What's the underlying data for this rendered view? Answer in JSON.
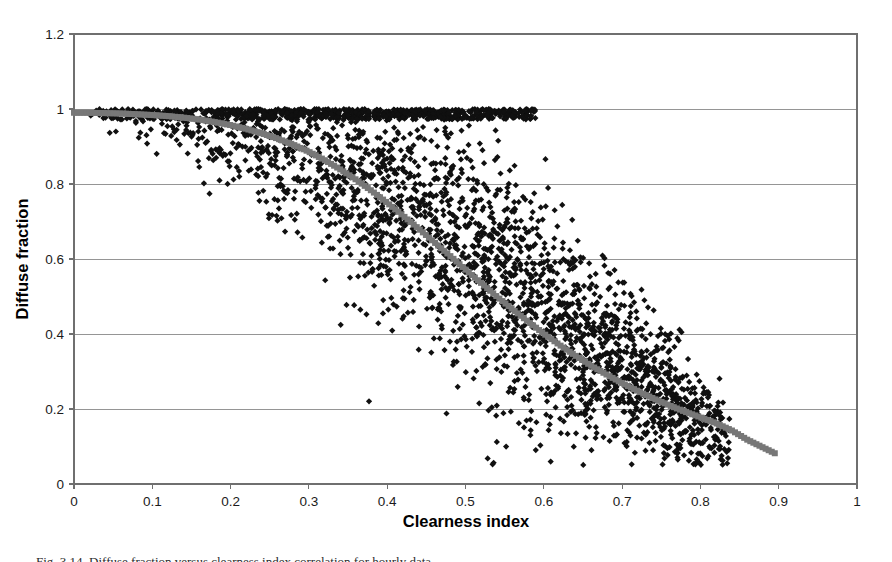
{
  "figure": {
    "background_color": "#ffffff",
    "caption": "Fig. 3.14. Diffuse fraction versus clearness index correlation for hourly data."
  },
  "chart_data": {
    "type": "scatter",
    "title": "",
    "xlabel": "Clearness index",
    "ylabel": "Diffuse fraction",
    "xlim": [
      0,
      1
    ],
    "ylim": [
      0,
      1.2
    ],
    "xticks": [
      0,
      0.1,
      0.2,
      0.3,
      0.4,
      0.5,
      0.6,
      0.7,
      0.8,
      0.9,
      1
    ],
    "yticks": [
      0,
      0.2,
      0.4,
      0.6,
      0.8,
      1,
      1.2
    ],
    "xtick_labels": [
      "0",
      "0.1",
      "0.2",
      "0.3",
      "0.4",
      "0.5",
      "0.6",
      "0.7",
      "0.8",
      "0.9",
      "1"
    ],
    "ytick_labels": [
      "0",
      "0.2",
      "0.4",
      "0.6",
      "0.8",
      "1",
      "1.2"
    ],
    "grid": "horizontal",
    "grid_color": "#8a8a8a",
    "frame_color": "#6f6f6f",
    "legend": "none",
    "series": [
      {
        "name": "Measured hourly data",
        "marker": "diamond",
        "color": "#101010",
        "marker_size": 5.0,
        "point_count": 2600,
        "description": "Black diamond scatter cloud of measured diffuse fraction versus clearness index; saturated near diffuse fraction 1.0 for clearness index below 0.2, broad spread between 0.2 and 0.8, converging toward 0.1 at high clearness index.",
        "generator": {
          "kind": "diffuse-fraction-cloud",
          "seed": 20240517,
          "kt_min": 0.01,
          "kt_max": 0.84,
          "kt_mode": 0.62,
          "kt_shape_a": 2.45,
          "kt_shape_b": 1.42,
          "top_clip": 1.0,
          "top_clip_kt_limit": 0.59,
          "bottom_clip": 0.05,
          "mean_curve": {
            "note": "piecewise mean diffuse fraction versus clearness index",
            "kt": [
              0.0,
              0.05,
              0.1,
              0.15,
              0.2,
              0.25,
              0.3,
              0.35,
              0.4,
              0.45,
              0.5,
              0.55,
              0.6,
              0.65,
              0.7,
              0.75,
              0.8,
              0.84
            ],
            "kd": [
              0.985,
              0.982,
              0.975,
              0.962,
              0.942,
              0.912,
              0.872,
              0.82,
              0.758,
              0.688,
              0.612,
              0.532,
              0.452,
              0.375,
              0.3,
              0.232,
              0.172,
              0.135
            ]
          },
          "spread": {
            "kt": [
              0.0,
              0.05,
              0.1,
              0.15,
              0.2,
              0.25,
              0.3,
              0.35,
              0.4,
              0.45,
              0.5,
              0.55,
              0.6,
              0.65,
              0.7,
              0.75,
              0.8,
              0.84
            ],
            "sigma": [
              0.03,
              0.032,
              0.038,
              0.052,
              0.075,
              0.1,
              0.122,
              0.142,
              0.155,
              0.162,
              0.162,
              0.155,
              0.142,
              0.125,
              0.105,
              0.085,
              0.062,
              0.048
            ]
          }
        }
      },
      {
        "name": "Correlation model curve",
        "marker": "square",
        "color": "#777777",
        "marker_size": 6.0,
        "point_count": 230,
        "description": "Thick gray square-marker band tracing the fitted correlation; flat near 0.99 at low clearness index, sigmoidal drop through 0.6 around clearness index 0.5, trailing off to about 0.08 at clearness index 0.9.",
        "curve_points": {
          "kt": [
            0.0,
            0.02,
            0.04,
            0.06,
            0.08,
            0.1,
            0.12,
            0.14,
            0.16,
            0.18,
            0.2,
            0.22,
            0.24,
            0.26,
            0.28,
            0.3,
            0.32,
            0.34,
            0.36,
            0.38,
            0.4,
            0.42,
            0.44,
            0.46,
            0.48,
            0.5,
            0.52,
            0.54,
            0.56,
            0.58,
            0.6,
            0.62,
            0.64,
            0.66,
            0.68,
            0.7,
            0.72,
            0.74,
            0.76,
            0.78,
            0.8,
            0.82,
            0.84,
            0.86,
            0.895
          ],
          "kd": [
            0.99,
            0.99,
            0.989,
            0.988,
            0.986,
            0.984,
            0.981,
            0.977,
            0.972,
            0.965,
            0.957,
            0.947,
            0.935,
            0.921,
            0.905,
            0.886,
            0.864,
            0.839,
            0.812,
            0.782,
            0.75,
            0.716,
            0.681,
            0.645,
            0.609,
            0.572,
            0.536,
            0.5,
            0.466,
            0.433,
            0.401,
            0.371,
            0.343,
            0.316,
            0.292,
            0.269,
            0.248,
            0.228,
            0.21,
            0.193,
            0.178,
            0.162,
            0.143,
            0.118,
            0.082
          ]
        }
      }
    ]
  },
  "axes": {
    "x_title": "Clearness index",
    "y_title": "Diffuse fraction"
  }
}
